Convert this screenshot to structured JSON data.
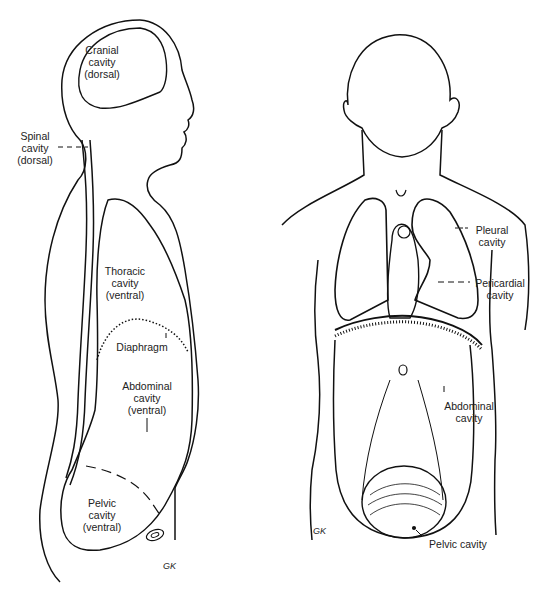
{
  "diagram": {
    "type": "anatomical body cavities",
    "side_view": {
      "labels": {
        "cranial": [
          "Cranial",
          "cavity",
          "(dorsal)"
        ],
        "spinal": [
          "Spinal",
          "cavity",
          "(dorsal)"
        ],
        "thoracic": [
          "Thoracic",
          "cavity",
          "(ventral)"
        ],
        "diaphragm": [
          "Diaphragm"
        ],
        "abdominal": [
          "Abdominal",
          "cavity",
          "(ventral)"
        ],
        "pelvic": [
          "Pelvic",
          "cavity",
          "(ventral)"
        ]
      }
    },
    "front_view": {
      "labels": {
        "pleural": [
          "Pleural",
          "cavity"
        ],
        "pericardial": [
          "Pericardial",
          "cavity"
        ],
        "abdominal": [
          "Abdominal",
          "cavity"
        ],
        "pelvic": [
          "Pelvic cavity"
        ]
      }
    },
    "signature": "GK",
    "colors": {
      "line": "#111111",
      "background": "#ffffff"
    }
  }
}
